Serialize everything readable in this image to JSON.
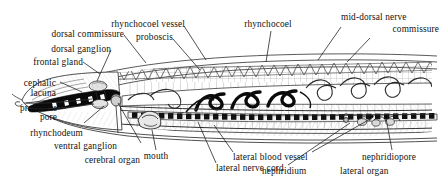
{
  "figure": {
    "organism": "nemertean ribbon worm",
    "view": "lateral longitudinal section, anterior to the left",
    "style": "black-and-white engraved line drawing",
    "background_color": "#ffffff",
    "ink_color": "#111111"
  },
  "labels": {
    "dorsal_commissure": "dorsal commissure",
    "dorsal_ganglion": "dorsal ganglion",
    "frontal_gland": "frontal gland",
    "cephalic_lacuna_l1": "cephalic",
    "cephalic_lacuna_l2": "lacuna",
    "proboscis_pore_l1": "proboscis",
    "proboscis_pore_l2": "pore",
    "rhynchodeum": "rhynchodeum",
    "ventral_ganglion": "ventral ganglion",
    "cerebral_organ": "cerebral organ",
    "rhynchocoel_vessel": "rhynchocoel vessel",
    "proboscis": "proboscis",
    "rhynchocoel": "rhynchocoel",
    "mid_dorsal_nerve_l1": "mid-dorsal nerve",
    "mid_dorsal_nerve_l2": "commissure",
    "mouth": "mouth",
    "lateral_blood_vessel": "lateral blood vessel",
    "lateral_nerve_cord": "lateral nerve cord",
    "nephridium": "nephridium",
    "nephridiopore": "nephridiopore",
    "lateral_organ": "lateral organ"
  }
}
